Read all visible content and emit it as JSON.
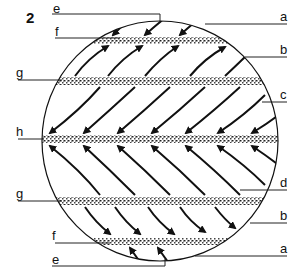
{
  "figure": {
    "number": "2"
  },
  "labels": {
    "left": [
      {
        "id": "e_top",
        "text": "e"
      },
      {
        "id": "f_top",
        "text": "f"
      },
      {
        "id": "g_top",
        "text": "g"
      },
      {
        "id": "h",
        "text": "h"
      },
      {
        "id": "g_bottom",
        "text": "g"
      },
      {
        "id": "f_bottom",
        "text": "f"
      },
      {
        "id": "e_bottom",
        "text": "e"
      }
    ],
    "right": [
      {
        "id": "a_top",
        "text": "a"
      },
      {
        "id": "b_top",
        "text": "b"
      },
      {
        "id": "c",
        "text": "c"
      },
      {
        "id": "d",
        "text": "d"
      },
      {
        "id": "b_bottom",
        "text": "b"
      },
      {
        "id": "a_bottom",
        "text": "a"
      }
    ]
  },
  "bands": [
    "north-polar-high",
    "north-subpolar-low",
    "equatorial-low",
    "south-subpolar-low",
    "south-polar-high"
  ],
  "colors": {
    "ink": "#111111",
    "band": "#555555",
    "background": "#ffffff"
  }
}
